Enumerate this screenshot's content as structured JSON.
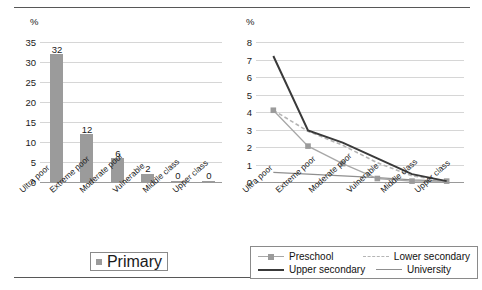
{
  "figure": {
    "has_top_rule": true,
    "has_bottom_rule": true,
    "background": "#ffffff"
  },
  "chart_data": [
    {
      "id": "bar-chart",
      "type": "bar",
      "title": "",
      "xlabel": "",
      "ylabel": "%",
      "ylim": [
        0,
        35
      ],
      "yticks": [
        0,
        5,
        10,
        15,
        20,
        25,
        30,
        35
      ],
      "grid": true,
      "legend_position": "bottom",
      "categories": [
        "Ultra poor",
        "Extreme poor",
        "Moderate poor",
        "Vulnerable",
        "Middle class",
        "Upper class"
      ],
      "series": [
        {
          "name": "Primary",
          "color": "#9b9b9b",
          "values": [
            32,
            12,
            6,
            2,
            0,
            0
          ],
          "data_labels": [
            "32",
            "12",
            "6",
            "2",
            "0",
            "0"
          ]
        }
      ]
    },
    {
      "id": "line-chart",
      "type": "line",
      "title": "",
      "xlabel": "",
      "ylabel": "%",
      "ylim": [
        0,
        8
      ],
      "yticks": [
        0,
        1,
        2,
        3,
        4,
        5,
        6,
        7,
        8
      ],
      "grid": true,
      "legend_position": "bottom",
      "categories": [
        "Ultra poor",
        "Extreme poor",
        "Moderate poor",
        "Vulnerable",
        "Middle class",
        "Upper class"
      ],
      "series": [
        {
          "name": "Preschool",
          "color": "#a7a7a7",
          "style": "solid-marker",
          "values": [
            4.1,
            2.05,
            1.05,
            0.2,
            0.05,
            0.05
          ]
        },
        {
          "name": "Lower secondary",
          "color": "#b5b5b5",
          "style": "dashed",
          "values": [
            4.1,
            2.9,
            2.1,
            1.1,
            0.35,
            0.05
          ]
        },
        {
          "name": "Upper secondary",
          "color": "#3a3a3a",
          "style": "thick-solid",
          "values": [
            7.2,
            2.95,
            2.25,
            1.35,
            0.45,
            0.05
          ]
        },
        {
          "name": "University",
          "color": "#8f8f8f",
          "style": "thin-solid",
          "values": [
            0.55,
            0.45,
            0.35,
            0.25,
            0.12,
            0.05
          ]
        }
      ]
    }
  ],
  "left_chart": {
    "unit": "%",
    "yticks": [
      "35",
      "30",
      "25",
      "20",
      "15",
      "10",
      "5",
      "0"
    ],
    "xticks": [
      "Ultra poor",
      "Extreme poor",
      "Moderate poor",
      "Vulnerable",
      "Middle class",
      "Upper class"
    ],
    "bar_labels": [
      "32",
      "12",
      "6",
      "2",
      "0",
      "0"
    ],
    "legend": [
      {
        "label": "Primary",
        "marker": "square-swatch"
      }
    ]
  },
  "right_chart": {
    "unit": "%",
    "yticks": [
      "8",
      "7",
      "6",
      "5",
      "4",
      "3",
      "2",
      "1",
      "0"
    ],
    "xticks": [
      "Ultra poor",
      "Extreme poor",
      "Moderate poor",
      "Vulnerable",
      "Middle class",
      "Upper class"
    ],
    "legend": [
      {
        "label": "Preschool",
        "marker": "line-with-square"
      },
      {
        "label": "Lower secondary",
        "marker": "dashed-line"
      },
      {
        "label": "Upper secondary",
        "marker": "thick-line"
      },
      {
        "label": "University",
        "marker": "thin-line"
      }
    ]
  }
}
